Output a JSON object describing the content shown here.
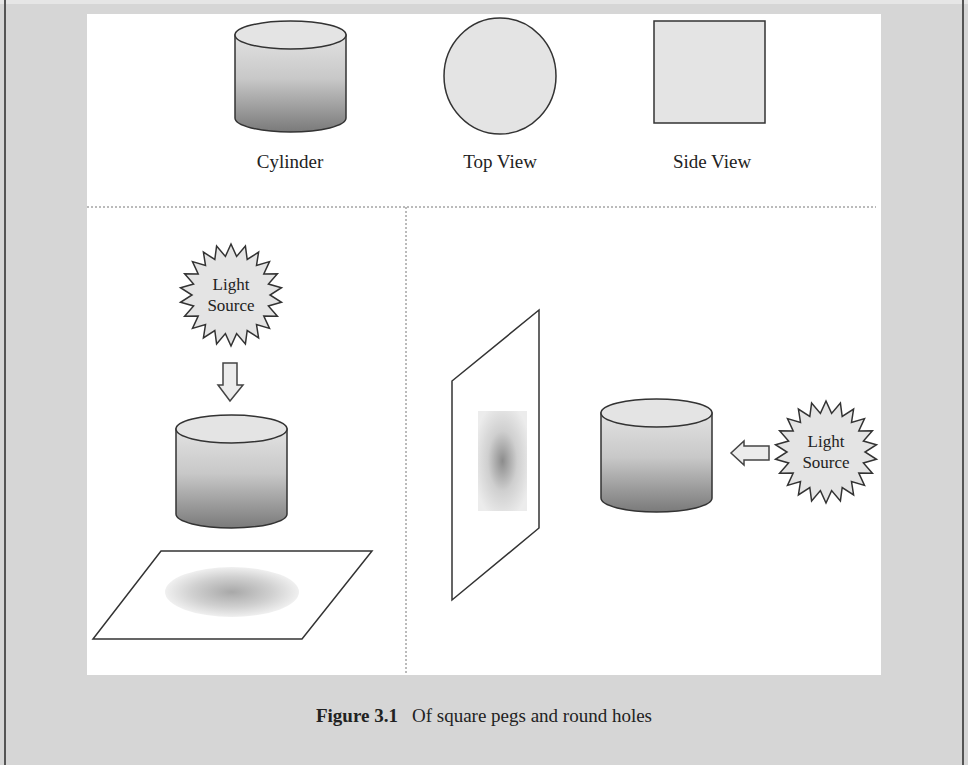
{
  "figure": {
    "number": "Figure 3.1",
    "caption": "Of square pegs and round holes",
    "top_row": {
      "labels": [
        "Cylinder",
        "Top View",
        "Side View"
      ]
    },
    "left_panel": {
      "light_source_label_line1": "Light",
      "light_source_label_line2": "Source",
      "light_direction": "down",
      "shadow_shape": "ellipse"
    },
    "right_panel": {
      "light_source_label_line1": "Light",
      "light_source_label_line2": "Source",
      "light_direction": "left",
      "shadow_shape": "rectangle"
    }
  },
  "colors": {
    "background": "#d6d6d6",
    "panel": "#ffffff",
    "stroke": "#333333",
    "shape_fill": "#e4e4e4"
  }
}
